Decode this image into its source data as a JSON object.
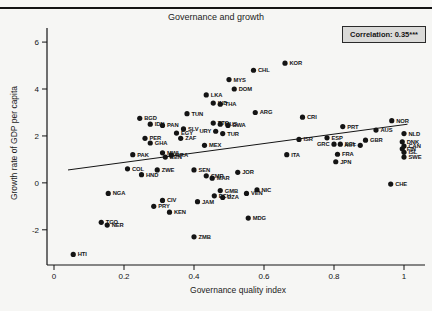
{
  "figure": {
    "background_color": "#f6f6f4",
    "ink_color": "#141414",
    "correlation_box_bg": "#dadad8"
  },
  "chart_data": {
    "type": "scatter",
    "title": "Governance and growth",
    "annotation": "Correlation: 0.35***",
    "xlabel": "Governance quality index",
    "ylabel": "Growth rate of GDP per capita",
    "xlim": [
      -0.02,
      1.06
    ],
    "ylim": [
      -3.5,
      6.6
    ],
    "xticks": [
      0,
      0.2,
      0.4,
      0.6,
      0.8,
      1
    ],
    "yticks": [
      -2,
      0,
      2,
      4,
      6
    ],
    "grid": false,
    "marker_color": "#141414",
    "trendline": {
      "x1": 0.04,
      "y1": 0.55,
      "x2": 1.01,
      "y2": 2.5
    },
    "points": [
      {
        "c": "HTI",
        "x": 0.055,
        "y": -3.05
      },
      {
        "c": "TGO",
        "x": 0.135,
        "y": -1.68
      },
      {
        "c": "NER",
        "x": 0.152,
        "y": -1.8
      },
      {
        "c": "NGA",
        "x": 0.155,
        "y": -0.45
      },
      {
        "c": "COL",
        "x": 0.21,
        "y": 0.6
      },
      {
        "c": "PAK",
        "x": 0.225,
        "y": 1.2
      },
      {
        "c": "BGD",
        "x": 0.245,
        "y": 2.75
      },
      {
        "c": "HND",
        "x": 0.25,
        "y": 0.35
      },
      {
        "c": "PER",
        "x": 0.26,
        "y": 1.9
      },
      {
        "c": "IDN",
        "x": 0.275,
        "y": 2.5
      },
      {
        "c": "GHA",
        "x": 0.275,
        "y": 1.7
      },
      {
        "c": "PRY",
        "x": 0.285,
        "y": -1.0
      },
      {
        "c": "ZWE",
        "x": 0.295,
        "y": 0.55
      },
      {
        "c": "CIV",
        "x": 0.31,
        "y": -0.75
      },
      {
        "c": "PAN",
        "x": 0.31,
        "y": 2.45
      },
      {
        "c": "MWI",
        "x": 0.31,
        "y": 1.28
      },
      {
        "c": "BEN",
        "x": 0.318,
        "y": 1.1
      },
      {
        "c": "KEN",
        "x": 0.33,
        "y": -1.25
      },
      {
        "c": "BRA",
        "x": 0.335,
        "y": 1.18
      },
      {
        "c": "EGY",
        "x": 0.35,
        "y": 2.12
      },
      {
        "c": "ZAF",
        "x": 0.362,
        "y": 1.9
      },
      {
        "c": "SLV",
        "x": 0.37,
        "y": 2.3
      },
      {
        "c": "TUN",
        "x": 0.38,
        "y": 2.95
      },
      {
        "c": "ZMB",
        "x": 0.4,
        "y": -2.3
      },
      {
        "c": "SEN",
        "x": 0.4,
        "y": 0.55
      },
      {
        "c": "JAM",
        "x": 0.41,
        "y": -0.8
      },
      {
        "c": "MEX",
        "x": 0.43,
        "y": 1.6
      },
      {
        "c": "LKA",
        "x": 0.435,
        "y": 3.75
      },
      {
        "c": "CMR",
        "x": 0.435,
        "y": 0.3
      },
      {
        "c": "MAR",
        "x": 0.452,
        "y": 0.2
      },
      {
        "c": "IND",
        "x": 0.455,
        "y": 3.4
      },
      {
        "c": "TTO",
        "x": 0.455,
        "y": 2.55
      },
      {
        "c": "ECU",
        "x": 0.458,
        "y": -0.55
      },
      {
        "c": "URY",
        "x": 0.462,
        "y": 2.2,
        "s": "l"
      },
      {
        "c": "THA",
        "x": 0.475,
        "y": 3.35
      },
      {
        "c": "MUS",
        "x": 0.475,
        "y": 2.5
      },
      {
        "c": "GMB",
        "x": 0.475,
        "y": -0.33
      },
      {
        "c": "TUR",
        "x": 0.482,
        "y": 2.1
      },
      {
        "c": "DZA",
        "x": 0.482,
        "y": -0.62
      },
      {
        "c": "BWA",
        "x": 0.497,
        "y": 2.45
      },
      {
        "c": "MYS",
        "x": 0.5,
        "y": 4.4
      },
      {
        "c": "DOM",
        "x": 0.515,
        "y": 4.0
      },
      {
        "c": "JOR",
        "x": 0.525,
        "y": 0.45
      },
      {
        "c": "VEN",
        "x": 0.55,
        "y": -0.45
      },
      {
        "c": "MDG",
        "x": 0.555,
        "y": -1.5
      },
      {
        "c": "CHL",
        "x": 0.57,
        "y": 4.8
      },
      {
        "c": "ARG",
        "x": 0.575,
        "y": 3.0
      },
      {
        "c": "NIC",
        "x": 0.58,
        "y": -0.3
      },
      {
        "c": "KOR",
        "x": 0.66,
        "y": 5.1
      },
      {
        "c": "ITA",
        "x": 0.665,
        "y": 1.2
      },
      {
        "c": "ISR",
        "x": 0.7,
        "y": 1.85
      },
      {
        "c": "CRI",
        "x": 0.71,
        "y": 2.8
      },
      {
        "c": "ESP",
        "x": 0.78,
        "y": 1.92
      },
      {
        "c": "GRC",
        "x": 0.8,
        "y": 1.65,
        "s": "l"
      },
      {
        "c": "JPN",
        "x": 0.805,
        "y": 0.9
      },
      {
        "c": "FRA",
        "x": 0.81,
        "y": 1.22
      },
      {
        "c": "BEL",
        "x": 0.818,
        "y": 1.65
      },
      {
        "c": "PRT",
        "x": 0.825,
        "y": 2.4
      },
      {
        "c": "AUT",
        "x": 0.875,
        "y": 1.6,
        "s": "l"
      },
      {
        "c": "GBR",
        "x": 0.89,
        "y": 1.82
      },
      {
        "c": "AUS",
        "x": 0.92,
        "y": 2.25
      },
      {
        "c": "CHE",
        "x": 0.962,
        "y": -0.05
      },
      {
        "c": "NOR",
        "x": 0.965,
        "y": 2.65
      },
      {
        "c": "DNK",
        "x": 0.995,
        "y": 1.75
      },
      {
        "c": "FIN",
        "x": 0.995,
        "y": 1.45
      },
      {
        "c": "NLD",
        "x": 1.0,
        "y": 2.1
      },
      {
        "c": "CAN",
        "x": 1.0,
        "y": 1.57
      },
      {
        "c": "ISL",
        "x": 1.0,
        "y": 1.3
      },
      {
        "c": "SWE",
        "x": 1.0,
        "y": 1.1
      }
    ]
  }
}
